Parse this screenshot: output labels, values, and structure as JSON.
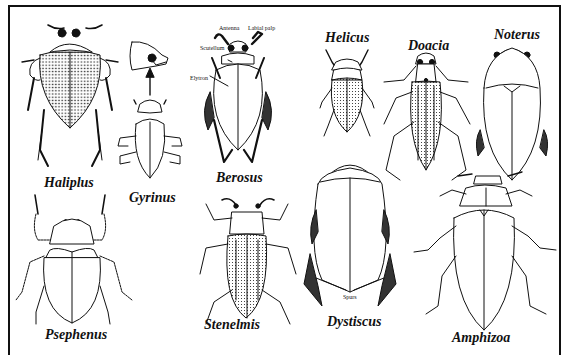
{
  "figure": {
    "type": "scientific-illustration",
    "colors": {
      "ink": "#111111",
      "background": "#ffffff"
    },
    "specimens": [
      {
        "name": "Haliplus",
        "pattern": "punctate-elytra"
      },
      {
        "name": "Gyrinus",
        "pattern": "plain",
        "inset": "divided compound eye detail"
      },
      {
        "name": "Berosus",
        "pattern": "plain"
      },
      {
        "name": "Helicus",
        "pattern": "stippled-elytra"
      },
      {
        "name": "Doacia",
        "pattern": "striate-stippled-elytra"
      },
      {
        "name": "Noterus",
        "pattern": "plain"
      },
      {
        "name": "Psephenus",
        "pattern": "plain"
      },
      {
        "name": "Stenelmis",
        "pattern": "stippled-elytra"
      },
      {
        "name": "Dystiscus",
        "pattern": "plain"
      },
      {
        "name": "Amphizoa",
        "pattern": "plain"
      }
    ],
    "annotations": {
      "antenna": "Antenna",
      "labial_palp": "Labial palp",
      "scutellum": "Scutellum",
      "elytron": "Elytron",
      "spurs": "Spurs"
    }
  }
}
